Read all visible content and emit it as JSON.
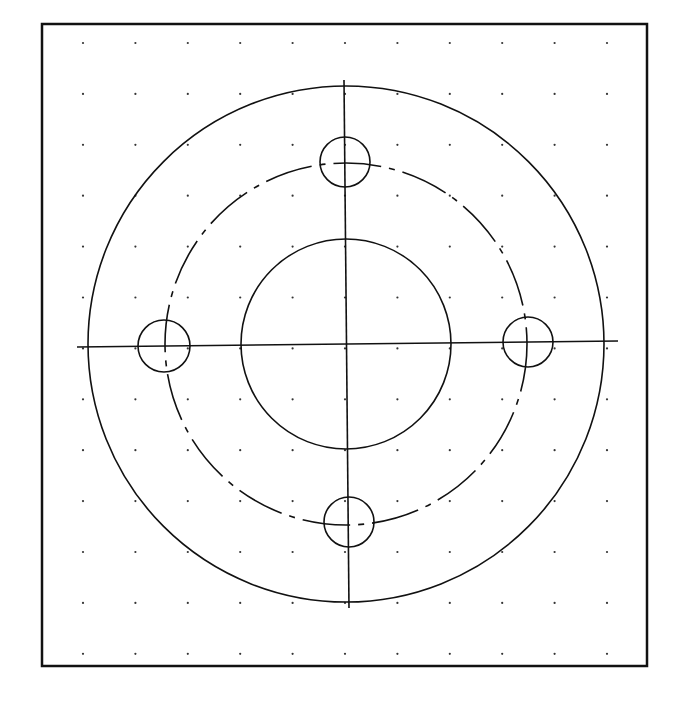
{
  "drawing": {
    "type": "flange-plan-view",
    "stroke_color": "#111111",
    "background": "#ffffff",
    "frame": {
      "x1": 42,
      "y1": 24,
      "x2": 647,
      "y2": 666,
      "stroke_width": 2.5
    },
    "grid": {
      "x_start": 83,
      "x_step": 52.4,
      "cols": 11,
      "y_start": 43,
      "y_step": 50.9,
      "rows": 13,
      "dot_radius": 1.1
    },
    "center": {
      "x": 346,
      "y": 344
    },
    "outer_circle": {
      "r": 258
    },
    "bolt_circle": {
      "r": 181,
      "style": "centerline-dashed"
    },
    "bore_circle": {
      "r": 105
    },
    "bolt_holes": [
      {
        "name": "top",
        "cx": 345,
        "cy": 162,
        "r": 25
      },
      {
        "name": "left",
        "cx": 164,
        "cy": 346,
        "r": 26
      },
      {
        "name": "right",
        "cx": 528,
        "cy": 342,
        "r": 25
      },
      {
        "name": "bottom",
        "cx": 349,
        "cy": 522,
        "r": 25
      }
    ],
    "center_lines": {
      "horizontal": {
        "x1": 77,
        "y1": 347,
        "x2": 618,
        "y2": 341
      },
      "vertical": {
        "x1": 344,
        "y1": 80,
        "x2": 349,
        "y2": 608
      }
    }
  }
}
